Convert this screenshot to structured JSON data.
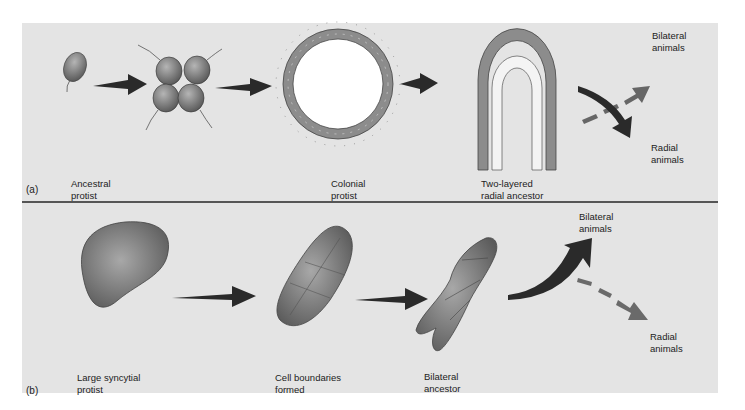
{
  "figure": {
    "panel_a": {
      "part_label": "(a)",
      "stages": [
        {
          "label": "Ancestral\nprotist"
        },
        {
          "label": "Colonial\nprotist"
        },
        {
          "label": "Two-layered\nradial ancestor"
        }
      ],
      "outcomes": [
        {
          "label": "Bilateral\nanimals",
          "arrow": "dashed"
        },
        {
          "label": "Radial\nanimals",
          "arrow": "solid"
        }
      ]
    },
    "panel_b": {
      "part_label": "(b)",
      "stages": [
        {
          "label": "Large syncytial\nprotist"
        },
        {
          "label": "Cell boundaries\nformed"
        },
        {
          "label": "Bilateral\nancestor"
        }
      ],
      "outcomes": [
        {
          "label": "Bilateral\nanimals",
          "arrow": "solid"
        },
        {
          "label": "Radial\nanimals",
          "arrow": "dashed"
        }
      ]
    },
    "colors": {
      "background": "#e4e4e4",
      "arrow_dark": "#2a2a2a",
      "arrow_dashed": "#666666",
      "cell_fill": "#8a8a8a",
      "divider": "#555555"
    }
  }
}
